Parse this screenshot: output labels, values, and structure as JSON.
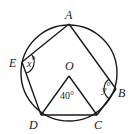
{
  "diagram": {
    "type": "circle-geometry",
    "circle": {
      "center": "O",
      "cx": 69,
      "cy": 73,
      "r": 48
    },
    "points": {
      "A": {
        "label": "A",
        "x": 69,
        "y": 24
      },
      "B": {
        "label": "B",
        "x": 116,
        "y": 89
      },
      "C": {
        "label": "C",
        "x": 97,
        "y": 115
      },
      "D": {
        "label": "D",
        "x": 41,
        "y": 115
      },
      "E": {
        "label": "E",
        "x": 22,
        "y": 62
      },
      "O": {
        "label": "O",
        "x": 69,
        "y": 76
      }
    },
    "segments": [
      "AE",
      "ED",
      "DC",
      "CB",
      "BA",
      "OD",
      "OC"
    ],
    "angles": {
      "x": {
        "vertex": "E",
        "var": "x",
        "unit": "°"
      },
      "y": {
        "vertex": "B",
        "var": "y",
        "unit": "°"
      },
      "O": {
        "vertex": "O",
        "value": "40°"
      }
    }
  }
}
